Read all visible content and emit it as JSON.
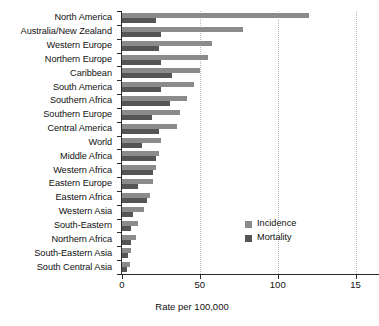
{
  "chart_data": {
    "type": "bar",
    "orientation": "horizontal",
    "title": "",
    "subtitle": "",
    "xlabel": "Rate per 100,000",
    "ylabel": "",
    "xlim": [
      0,
      165
    ],
    "xticks": [
      0,
      50,
      100,
      150
    ],
    "xticklabels": [
      "0",
      "50",
      "100",
      "15"
    ],
    "grid": "vertical-dotted",
    "legend_position": "inside-lower-right",
    "categories": [
      "North America",
      "Australia/New Zealand",
      "Western Europe",
      "Northern Europe",
      "Caribbean",
      "South America",
      "Southern Africa",
      "Southern Europe",
      "Central America",
      "World",
      "Middle Africa",
      "Western Africa",
      "Eastern Europe",
      "Eastern Africa",
      "Western Asia",
      "South-Eastern",
      "Northern Africa",
      "South-Eastern Asia",
      "South Central Asia"
    ],
    "series": [
      {
        "name": "Incidence",
        "color": "#8b8b8b",
        "values": [
          120,
          78,
          58,
          55,
          50,
          46,
          42,
          37,
          35,
          25,
          24,
          22,
          20,
          18,
          14,
          10,
          9,
          6,
          5
        ]
      },
      {
        "name": "Mortality",
        "color": "#555555",
        "values": [
          22,
          25,
          24,
          25,
          32,
          25,
          31,
          19,
          24,
          13,
          22,
          20,
          10,
          16,
          7,
          6,
          6,
          4,
          3
        ]
      }
    ]
  },
  "legend": {
    "items": [
      {
        "label": "Incidence",
        "color": "#8b8b8b"
      },
      {
        "label": "Mortality",
        "color": "#555555"
      }
    ]
  }
}
